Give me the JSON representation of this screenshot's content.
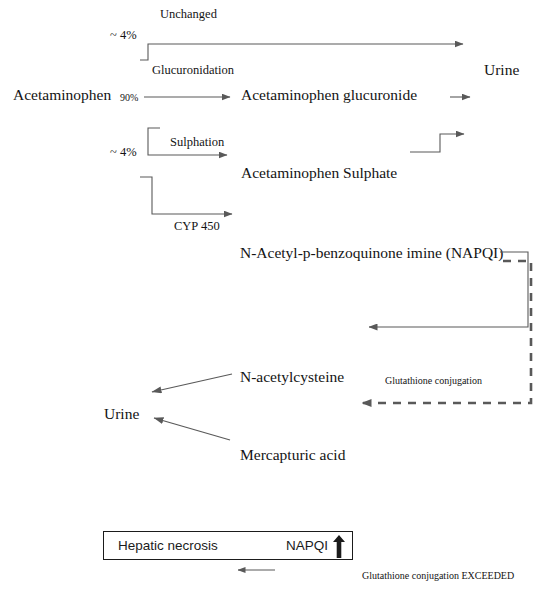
{
  "figure": {
    "background_color": "#ffffff",
    "line_color": "#595959",
    "text_color": "#141414",
    "box_color": "#1b1b1b"
  },
  "labels": {
    "unchanged": "Unchanged",
    "pct_unchanged": "~ 4%",
    "glucuronidation": "Glucuronidation",
    "acetaminophen": "Acetaminophen",
    "pct_glucuronidation": "90%",
    "acetaminophen_glucuronide": "Acetaminophen glucuronide",
    "urine_top": "Urine",
    "pct_sulphation": "~ 4%",
    "sulphation": "Sulphation",
    "acetaminophen_sulphate": "Acetaminophen Sulphate",
    "cyp450": "CYP 450",
    "napqi_full": "N-Acetyl-p-benzoquinone imine (NAPQI)",
    "n_acetylcysteine": "N-acetylcysteine",
    "glutathione_conjugation": "Glutathione conjugation",
    "urine_bottom": "Urine",
    "mercapturic_acid": "Mercapturic acid",
    "hepatic_necrosis": "Hepatic necrosis",
    "napqi_short": "NAPQI",
    "glutathione_exceeded": "Glutathione conjugation EXCEEDED"
  },
  "icons": {
    "napqi_increase": "up-arrow-icon"
  }
}
